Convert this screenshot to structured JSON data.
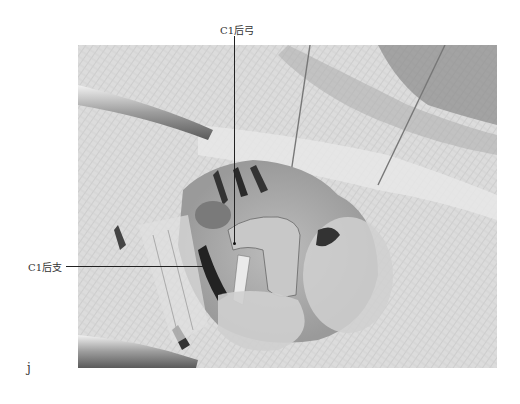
{
  "figure": {
    "panel_label": "j",
    "image_description": "Grayscale intraoperative photograph of posterior cervical exposure with retractors and sutures",
    "annotations": [
      {
        "id": "c1-posterior-arch",
        "text": "C1后弓"
      },
      {
        "id": "c1-posterior-ramus",
        "text": "C1后支"
      }
    ]
  }
}
